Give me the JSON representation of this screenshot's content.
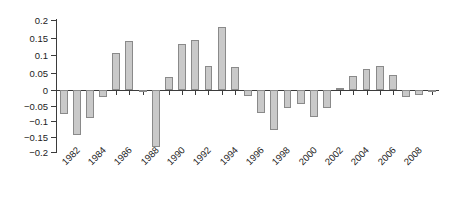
{
  "chart_data": {
    "type": "bar",
    "title": "",
    "subtitle": "",
    "xlabel": "",
    "ylabel": "",
    "xlim": [
      1981.5,
      2010.5
    ],
    "ylim": [
      -0.2,
      0.2
    ],
    "grid": false,
    "legend": null,
    "legend_position": "none",
    "y_ticks": [
      0.2,
      0.15,
      0.1,
      0.05,
      0,
      -0.05,
      -0.1,
      -0.15,
      -0.2
    ],
    "y_tick_labels": [
      "0.2",
      "0.15",
      "0.1",
      "0.05",
      "0",
      "−0.05",
      "−0.1",
      "−0.15",
      "−0.2"
    ],
    "x_tick_labels": [
      "1982",
      "1984",
      "1986",
      "1988",
      "1990",
      "1992",
      "1994",
      "1996",
      "1998",
      "2000",
      "2002",
      "2004",
      "2006",
      "2008"
    ],
    "x_tick_values": [
      1982,
      1984,
      1986,
      1988,
      1990,
      1992,
      1994,
      1996,
      1998,
      2000,
      2002,
      2004,
      2006,
      2008
    ],
    "bar_fill_color": "#c9c9c9",
    "bar_edge_color": "#8a8a8a",
    "axis_color": "#3b3b3b",
    "background_color": "#ffffff",
    "categories": [
      1982,
      1983,
      1984,
      1985,
      1986,
      1987,
      1988,
      1989,
      1990,
      1991,
      1992,
      1993,
      1994,
      1995,
      1996,
      1997,
      1998,
      1999,
      2000,
      2001,
      2002,
      2003,
      2004,
      2005,
      2006,
      2007,
      2008,
      2009,
      2010
    ],
    "values": [
      -0.076,
      -0.146,
      -0.09,
      -0.022,
      0.107,
      0.141,
      -0.006,
      -0.183,
      0.038,
      0.132,
      0.142,
      0.068,
      0.179,
      0.066,
      -0.02,
      -0.075,
      -0.13,
      -0.058,
      -0.044,
      -0.088,
      -0.057,
      0.005,
      0.041,
      0.061,
      0.068,
      0.044,
      -0.022,
      -0.016,
      0.0
    ],
    "series": [
      {
        "name": "value",
        "values": [
          -0.076,
          -0.146,
          -0.09,
          -0.022,
          0.107,
          0.141,
          -0.006,
          -0.183,
          0.038,
          0.132,
          0.142,
          0.068,
          0.179,
          0.066,
          -0.02,
          -0.075,
          -0.13,
          -0.058,
          -0.044,
          -0.088,
          -0.057,
          0.005,
          0.041,
          0.061,
          0.068,
          0.044,
          -0.022,
          -0.016,
          0.0
        ]
      }
    ]
  }
}
